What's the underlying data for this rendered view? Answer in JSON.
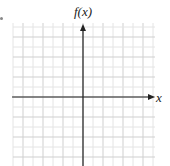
{
  "graph": {
    "y_axis_label": "f(x)",
    "x_axis_label": "x",
    "grid": {
      "left": 13,
      "top": 23,
      "right": 155,
      "bottom": 166,
      "cell": 10,
      "minor_color": "#e4e4e4",
      "major_color": "#cfcfcf"
    },
    "origin": {
      "x": 83,
      "y": 97
    },
    "axis_color": "#222222"
  },
  "chart_data": {
    "type": "line",
    "title": "",
    "xlabel": "x",
    "ylabel": "f(x)",
    "series": [],
    "grid": true,
    "note": "Blank coordinate grid with x-axis and f(x)-axis, arrows on positive ends"
  }
}
